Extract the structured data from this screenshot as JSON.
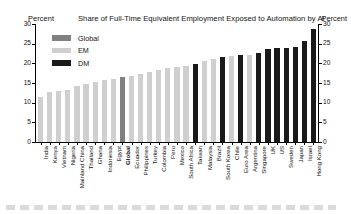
{
  "header": {
    "left_axis_label": "Percent",
    "title": "Share of Full-Time Equivalent Employment Exposed to Automation by AI",
    "right_axis_label": "Percent"
  },
  "legend": {
    "position": "top-left",
    "items": [
      {
        "label": "Global",
        "color": "#808080",
        "key": "Global"
      },
      {
        "label": "EM",
        "color": "#cfcfcf",
        "key": "EM"
      },
      {
        "label": "DM",
        "color": "#1a1a1a",
        "key": "DM"
      }
    ]
  },
  "chart_data": {
    "type": "bar",
    "title": "Share of Full-Time Equivalent Employment Exposed to Automation by AI",
    "xlabel": "",
    "ylabel": "Percent",
    "ylim": [
      0,
      30
    ],
    "yticks": [
      0,
      5,
      10,
      15,
      20,
      25,
      30
    ],
    "right_axis": {
      "label": "Percent",
      "ticks": [
        0,
        5,
        10,
        15,
        20,
        25,
        30
      ],
      "lim": [
        0,
        30
      ]
    },
    "grid": false,
    "legend_position": "top-left",
    "group_colors": {
      "Global": "#808080",
      "EM": "#cfcfcf",
      "DM": "#1a1a1a"
    },
    "categories": [
      "India",
      "Kenya",
      "Vietnam",
      "Nigeria",
      "Mainland China",
      "Thailand",
      "Ghana",
      "Indonesia",
      "Egypt",
      "Global",
      "Ecuador",
      "Philippines",
      "Turkey",
      "Colombia",
      "Peru",
      "Mexico",
      "South Africa",
      "Taiwan",
      "Malaysia",
      "Brazil",
      "South Korea",
      "Chile",
      "Euro Area",
      "Argentina",
      "Singapore",
      "UK",
      "US",
      "Sweden",
      "Japan",
      "Israel",
      "Hong Kong"
    ],
    "groups": [
      "EM",
      "EM",
      "EM",
      "EM",
      "EM",
      "EM",
      "EM",
      "EM",
      "EM",
      "Global",
      "EM",
      "EM",
      "EM",
      "EM",
      "EM",
      "EM",
      "EM",
      "DM",
      "EM",
      "EM",
      "DM",
      "EM",
      "DM",
      "EM",
      "DM",
      "DM",
      "DM",
      "DM",
      "DM",
      "DM",
      "DM"
    ],
    "values": [
      11.4,
      12.6,
      12.9,
      13.1,
      14.2,
      14.8,
      15.3,
      15.7,
      16.1,
      16.6,
      16.9,
      17.2,
      17.9,
      18.3,
      18.7,
      19.0,
      19.4,
      19.9,
      20.6,
      21.1,
      21.6,
      21.8,
      22.1,
      22.2,
      22.6,
      23.7,
      23.8,
      23.9,
      24.2,
      25.8,
      28.7
    ]
  }
}
